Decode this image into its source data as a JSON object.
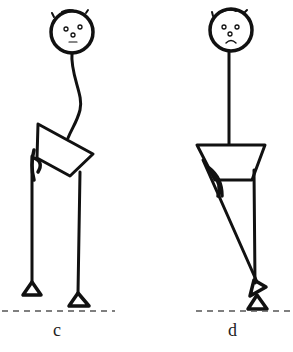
{
  "figure": {
    "panels": [
      {
        "id": "c",
        "label": "c",
        "face": "neutral",
        "posture": "curved spine, tilted pelvis"
      },
      {
        "id": "d",
        "label": "d",
        "face": "frown",
        "posture": "straight spine, one leg crossed diagonally"
      }
    ],
    "colors": {
      "ink": "#111111",
      "ground_line": "#555555",
      "background": "#ffffff"
    }
  }
}
